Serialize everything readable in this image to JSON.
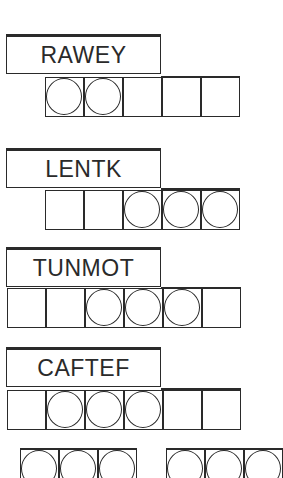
{
  "puzzle_type": "word-jumble",
  "scrambles": [
    {
      "word": "RAWEY",
      "top": 34,
      "cells_left": 45,
      "cell_count": 5,
      "circled": [
        0,
        1
      ],
      "cap_left": 162,
      "cap_width": 78
    },
    {
      "word": "LENTK",
      "top": 148,
      "cells_left": 45,
      "cell_count": 5,
      "circled": [
        2,
        3,
        4
      ],
      "cap_left": 162,
      "cap_width": 78
    },
    {
      "word": "TUNMOT",
      "top": 247,
      "cells_left": 7,
      "cell_count": 6,
      "circled": [
        2,
        3,
        4
      ],
      "cap_left": 162,
      "cap_width": 79
    },
    {
      "word": "CAFTEF",
      "top": 347,
      "cells_left": 7,
      "cell_count": 6,
      "circled": [
        1,
        2,
        3
      ],
      "cap_left": 162,
      "cap_width": 79
    }
  ],
  "answer_row": {
    "top": 448,
    "groups": [
      {
        "left": 20,
        "cell_count": 3
      },
      {
        "left": 166,
        "cell_count": 3
      }
    ]
  },
  "colors": {
    "ink": "#2a2a2a",
    "paper": "#ffffff"
  }
}
